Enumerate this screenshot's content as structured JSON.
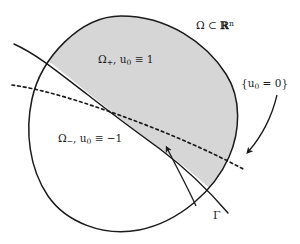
{
  "figure": {
    "width": 300,
    "height": 244,
    "background_color": "#ffffff",
    "stroke_color": "#1a1a1a",
    "shaded_region_color": "#d6d6d6"
  },
  "labels": {
    "domain": {
      "omega": "Ω",
      "subset": "⊂",
      "reals": "ℝ",
      "dimension": "n",
      "full_text": "Ω ⊂ ℝⁿ"
    },
    "omega_plus": {
      "omega": "Ω",
      "sub": "+",
      "comma": ", ",
      "u": "u",
      "u_sub": "0",
      "relation": " ≡ 1",
      "full_text": "Ω₊, u₀ ≡ 1"
    },
    "omega_minus": {
      "omega": "Ω",
      "sub": "−",
      "comma": ", ",
      "u": "u",
      "u_sub": "0",
      "relation": " ≡ −1",
      "full_text": "Ω₋, u₀ ≡ −1"
    },
    "zero_set": {
      "open_brace": "{",
      "u": "u",
      "u_sub": "0",
      "relation": " = 0",
      "close_brace": "}",
      "full_text": "{u₀ = 0}"
    },
    "interface": {
      "symbol": "Γ",
      "full_text": "Γ"
    }
  },
  "elements": {
    "domain_boundary_name": "domain-boundary-curve",
    "shaded_region_name": "omega-plus-shaded-region",
    "interface_curve_name": "gamma-interface-curve",
    "zero_level_curve_name": "zero-level-set-dashed-curve",
    "gamma_arrow_name": "gamma-pointer-arrow",
    "zero_set_arrow_name": "zero-set-pointer-arrow"
  }
}
